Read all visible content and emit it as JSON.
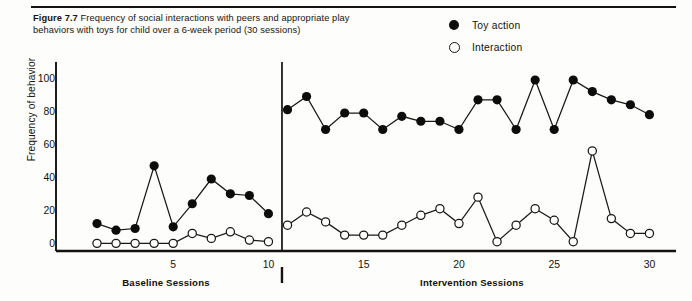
{
  "figure": {
    "number_label": "Figure 7.7",
    "caption": "Frequency of social interactions with peers and appropriate play behaviors with toys for child over a 6-week period (30 sessions)"
  },
  "legend": {
    "position": "top-right",
    "entries": [
      {
        "label": "Toy action",
        "marker": "filled-circle",
        "color": "#0c0c0c"
      },
      {
        "label": "Interaction",
        "marker": "open-circle",
        "color": "#ffffff"
      }
    ]
  },
  "phases": [
    {
      "label": "Baseline Sessions",
      "start": 1,
      "end": 10
    },
    {
      "label": "Intervention Sessions",
      "start": 11,
      "end": 30
    }
  ],
  "chart_data": {
    "type": "line",
    "title": "",
    "xlabel": "",
    "ylabel": "Frequency of behavior",
    "xlim": [
      0,
      31
    ],
    "ylim": [
      0,
      108
    ],
    "yticks": [
      0,
      20,
      40,
      60,
      80,
      100
    ],
    "xticks": [
      5,
      10,
      15,
      20,
      25,
      30
    ],
    "grid": false,
    "phase_change_after_x": 10,
    "x": [
      1,
      2,
      3,
      4,
      5,
      6,
      7,
      8,
      9,
      10,
      11,
      12,
      13,
      14,
      15,
      16,
      17,
      18,
      19,
      20,
      21,
      22,
      23,
      24,
      25,
      26,
      27,
      28,
      29,
      30
    ],
    "series": [
      {
        "name": "Toy action",
        "marker": "filled-circle",
        "color": "#0c0c0c",
        "values": [
          13,
          9,
          10,
          48,
          11,
          25,
          40,
          31,
          30,
          19,
          82,
          90,
          70,
          80,
          80,
          70,
          78,
          75,
          75,
          70,
          88,
          88,
          70,
          100,
          70,
          100,
          93,
          88,
          85,
          79
        ]
      },
      {
        "name": "Interaction",
        "marker": "open-circle",
        "color": "#ffffff",
        "values": [
          1,
          1,
          1,
          1,
          1,
          7,
          4,
          8,
          3,
          2,
          12,
          20,
          14,
          6,
          6,
          6,
          12,
          18,
          22,
          13,
          29,
          2,
          12,
          22,
          15,
          2,
          57,
          16,
          7,
          7
        ]
      }
    ]
  }
}
